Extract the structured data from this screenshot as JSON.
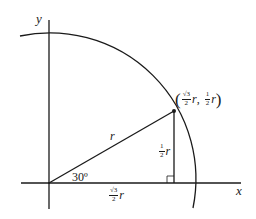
{
  "diagram": {
    "type": "unit-circle-quadrant",
    "colors": {
      "stroke": "#1a1a1a",
      "background": "#ffffff"
    },
    "axes": {
      "x_label": "x",
      "y_label": "y"
    },
    "radius_label": "r",
    "angle_label": "30º",
    "horizontal_leg": {
      "numerator": "√3",
      "denominator": "2",
      "variable": "r"
    },
    "vertical_leg": {
      "numerator": "1",
      "denominator": "2",
      "variable": "r"
    },
    "point": {
      "open_paren": "(",
      "close_paren": ")",
      "x_numerator": "√3",
      "x_denominator": "2",
      "x_variable": "r",
      "separator": ",",
      "y_numerator": "1",
      "y_denominator": "2",
      "y_variable": "r"
    },
    "geometry": {
      "origin": [
        49,
        183
      ],
      "radius_px": 146,
      "angle_deg": 30,
      "point_px": [
        174,
        111
      ]
    }
  }
}
